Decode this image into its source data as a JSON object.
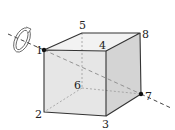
{
  "figure": {
    "type": "cube-rotation-diagram",
    "vertices": [
      {
        "id": "1",
        "label": "1",
        "x": 44,
        "y": 50,
        "label_x": 36,
        "label_y": 54,
        "marked": true
      },
      {
        "id": "2",
        "label": "2",
        "x": 44,
        "y": 112,
        "label_x": 35,
        "label_y": 118,
        "marked": false
      },
      {
        "id": "3",
        "label": "3",
        "x": 106,
        "y": 116,
        "label_x": 102,
        "label_y": 128,
        "marked": false
      },
      {
        "id": "4",
        "label": "4",
        "x": 106,
        "y": 51,
        "label_x": 99,
        "label_y": 49,
        "marked": false
      },
      {
        "id": "5",
        "label": "5",
        "x": 82,
        "y": 33,
        "label_x": 79,
        "label_y": 29,
        "marked": false
      },
      {
        "id": "6",
        "label": "6",
        "x": 82,
        "y": 88,
        "label_x": 74,
        "label_y": 89,
        "marked": false
      },
      {
        "id": "7",
        "label": "7",
        "x": 141,
        "y": 94,
        "label_x": 145,
        "label_y": 100,
        "marked": true
      },
      {
        "id": "8",
        "label": "8",
        "x": 140,
        "y": 33,
        "label_x": 142,
        "label_y": 38,
        "marked": false
      }
    ],
    "axis": {
      "from_label": "1",
      "to_label": "7",
      "style": "dashed"
    },
    "rotation_arrow": {
      "position": "around axis near vertex 1"
    },
    "colors": {
      "front_face": "#e6e6e6",
      "top_face": "#f2f2f2",
      "right_face": "#d4d4d4",
      "edge": "#333333",
      "hidden": "#999999",
      "axis": "#444444",
      "dot": "#111111"
    }
  }
}
